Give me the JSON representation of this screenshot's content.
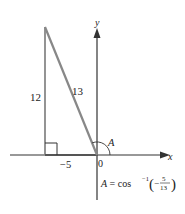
{
  "diagram": {
    "labels": {
      "vertical_leg": "12",
      "hypotenuse": "13",
      "horizontal_leg": "−5",
      "angle": "A",
      "origin": "0",
      "x_axis": "x",
      "y_axis": "y"
    },
    "formula": {
      "lhs": "A = cos",
      "exponent": "−1",
      "open_paren": "(",
      "sign": "−",
      "numerator": "5",
      "denominator": "13",
      "close_paren": ")"
    },
    "colors": {
      "triangle": "#888888",
      "axes": "#333333",
      "text": "#222222"
    }
  }
}
